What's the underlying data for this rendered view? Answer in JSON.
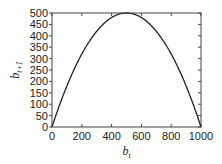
{
  "chart_data": {
    "type": "line",
    "title": "",
    "xlabel": "b_t",
    "ylabel": "b_{t+1}",
    "xlabel_main": "b",
    "xlabel_sub": "t",
    "ylabel_main": "b",
    "ylabel_sub": "t+1",
    "xlim": [
      0,
      1000
    ],
    "ylim": [
      0,
      500
    ],
    "xticks": [
      0,
      200,
      400,
      600,
      800,
      1000
    ],
    "yticks": [
      0,
      50,
      100,
      150,
      200,
      250,
      300,
      350,
      400,
      450,
      500
    ],
    "grid": false,
    "legend": null,
    "series": [
      {
        "name": "b_{t+1} = 2 b_t (1 - b_t/1000)",
        "x": [
          0,
          50,
          100,
          150,
          200,
          250,
          300,
          350,
          400,
          450,
          500,
          550,
          600,
          650,
          700,
          750,
          800,
          850,
          900,
          950,
          1000
        ],
        "y": [
          0,
          95,
          180,
          255,
          320,
          375,
          420,
          455,
          480,
          495,
          500,
          495,
          480,
          455,
          420,
          375,
          320,
          255,
          180,
          95,
          0
        ],
        "color": "#222222"
      }
    ]
  },
  "colors": {
    "axis": "#444444",
    "line": "#222222",
    "background": "#ffffff"
  }
}
